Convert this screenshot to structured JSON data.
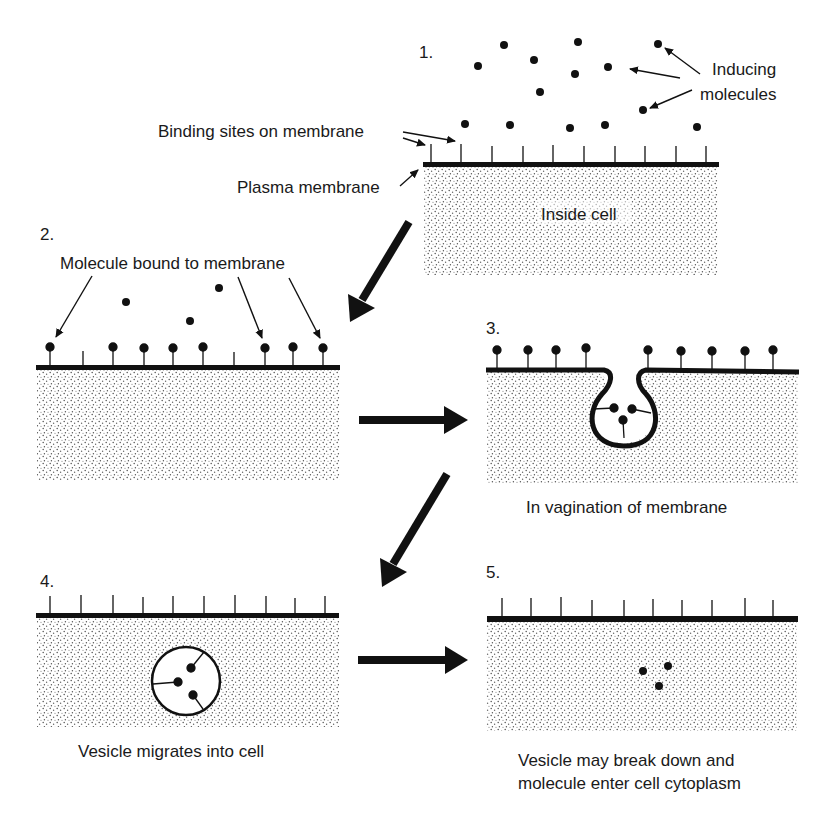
{
  "diagram": {
    "colors": {
      "ink": "#111111",
      "background": "#ffffff",
      "stipple": "#555555"
    },
    "steps": [
      {
        "number": "1.",
        "labels": {
          "inducing": "Inducing",
          "molecules": "molecules",
          "binding_sites": "Binding sites on membrane",
          "plasma_membrane": "Plasma membrane",
          "inside_cell": "Inside cell"
        }
      },
      {
        "number": "2.",
        "labels": {
          "bound": "Molecule bound to membrane"
        }
      },
      {
        "number": "3.",
        "caption": "In vagination of membrane"
      },
      {
        "number": "4.",
        "caption": "Vesicle migrates into cell"
      },
      {
        "number": "5.",
        "caption_line1": "Vesicle may break down and",
        "caption_line2": "molecule enter cell cytoplasm"
      }
    ]
  }
}
